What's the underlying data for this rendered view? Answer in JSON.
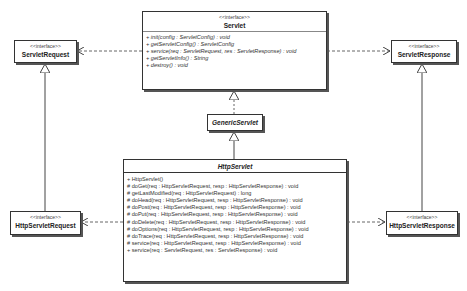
{
  "diagram": {
    "type": "uml-class-diagram",
    "classes": {
      "servlet": {
        "stereotype": "<<interface>>",
        "name": "Servlet",
        "operations": [
          "+ init(config : ServletConfig) : void",
          "+ getServletConfig() : ServletConfig",
          "+ service(req : ServletRequest, res : ServletResponse) : void",
          "+ getServletInfo() : String",
          "+ destroy() : void"
        ]
      },
      "servlet_request": {
        "stereotype": "<<interface>>",
        "name": "ServletRequest"
      },
      "servlet_response": {
        "stereotype": "<<interface>>",
        "name": "ServletResponse"
      },
      "generic_servlet": {
        "name": "GenericServlet"
      },
      "http_servlet": {
        "name": "HttpServlet",
        "operations": [
          "+ HttpServlet()",
          "# doGet(req : HttpServletRequest, resp : HttpServletResponse) : void",
          "# getLastModified(req : HttpServletRequest) : long",
          "# doHead(req : HttpServletRequest, resp : HttpServletResponse) : void",
          "# doPost(req : HttpServletRequest, resp : HttpServletResponse) : void",
          "# doPut(req : HttpServletRequest, resp : HttpServletResponse) : void",
          "# doDelete(req : HttpServletRequest, resp : HttpServletResponse) : void",
          "# doOptions(req : HttpServletRequest, resp : HttpServletResponse) : void",
          "# doTrace(req : HttpServletRequest, resp : HttpServletResponse) : void",
          "# service(req : HttpServletRequest, resp : HttpServletResponse) : void",
          "+ service(req : ServletRequest, res : ServletResponse) : void"
        ]
      },
      "http_servlet_request": {
        "stereotype": "<<interface>>",
        "name": "HttpServletRequest"
      },
      "http_servlet_response": {
        "stereotype": "<<interface>>",
        "name": "HttpServletResponse"
      }
    },
    "relations": [
      {
        "from": "Servlet",
        "to": "ServletRequest",
        "kind": "dependency"
      },
      {
        "from": "Servlet",
        "to": "ServletResponse",
        "kind": "dependency"
      },
      {
        "from": "GenericServlet",
        "to": "Servlet",
        "kind": "realization"
      },
      {
        "from": "HttpServlet",
        "to": "GenericServlet",
        "kind": "generalization"
      },
      {
        "from": "HttpServletRequest",
        "to": "ServletRequest",
        "kind": "generalization"
      },
      {
        "from": "HttpServletResponse",
        "to": "ServletResponse",
        "kind": "generalization"
      },
      {
        "from": "HttpServlet",
        "to": "HttpServletRequest",
        "kind": "dependency"
      },
      {
        "from": "HttpServlet",
        "to": "HttpServletResponse",
        "kind": "dependency"
      }
    ]
  }
}
